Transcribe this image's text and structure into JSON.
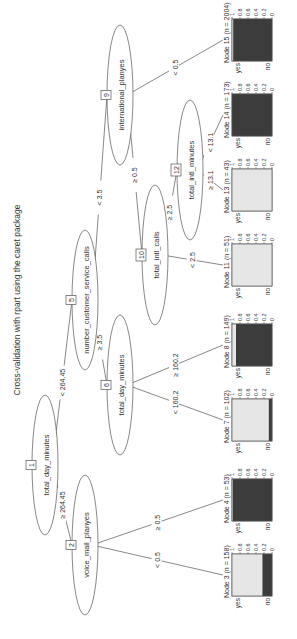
{
  "title": "Cross-validation with rpart using the caret package",
  "orientation": "rotated 90 degrees counter-clockwise",
  "colors": {
    "background": "#ffffff",
    "line": "#555555",
    "bar_yes": "#e6e6e6",
    "bar_no": "#3c3c3c",
    "text": "#333333"
  },
  "inner_nodes": [
    {
      "id": "1",
      "variable": "total_day_minutes",
      "cx": 174,
      "cy": 45,
      "rx": 70,
      "ry": 13
    },
    {
      "id": "2",
      "variable": "voice_mail_planyes",
      "cx": 94,
      "cy": 85,
      "rx": 70,
      "ry": 13
    },
    {
      "id": "5",
      "variable": "number_customer_service_calls",
      "cx": 339,
      "cy": 85,
      "rx": 70,
      "ry": 13
    },
    {
      "id": "6",
      "variable": "total_day_minutes",
      "cx": 254,
      "cy": 120,
      "rx": 70,
      "ry": 13
    },
    {
      "id": "9",
      "variable": "international_planyes",
      "cx": 544,
      "cy": 120,
      "rx": 70,
      "ry": 13
    },
    {
      "id": "10",
      "variable": "total_intl_calls",
      "cx": 384,
      "cy": 155,
      "rx": 70,
      "ry": 13
    },
    {
      "id": "12",
      "variable": "total_intl_minutes",
      "cx": 469,
      "cy": 190,
      "rx": 70,
      "ry": 13
    }
  ],
  "edges": [
    {
      "from": "1",
      "to": "2",
      "label": "≥ 264.45"
    },
    {
      "from": "1",
      "to": "5",
      "label": "< 264.45"
    },
    {
      "from": "2",
      "to": "3",
      "label": "< 0.5"
    },
    {
      "from": "2",
      "to": "4",
      "label": "≥ 0.5"
    },
    {
      "from": "5",
      "to": "6",
      "label": "≥ 3.5"
    },
    {
      "from": "5",
      "to": "9",
      "label": "< 3.5"
    },
    {
      "from": "6",
      "to": "7",
      "label": "< 160.2"
    },
    {
      "from": "6",
      "to": "8",
      "label": "≥ 160.2"
    },
    {
      "from": "9",
      "to": "10",
      "label": "≥ 0.5"
    },
    {
      "from": "9",
      "to": "15",
      "label": "< 0.5"
    },
    {
      "from": "10",
      "to": "11",
      "label": "< 2.5"
    },
    {
      "from": "10",
      "to": "12",
      "label": "≥ 2.5"
    },
    {
      "from": "12",
      "to": "13",
      "label": "≥ 13.1"
    },
    {
      "from": "12",
      "to": "14",
      "label": "< 13.1"
    }
  ],
  "leaves": [
    {
      "id": "3",
      "label": "Node 3 (n = 158)",
      "n": 158,
      "yes": 0.76,
      "no": 0.24,
      "cx": 64
    },
    {
      "id": "4",
      "label": "Node 4 (n = 53)",
      "n": 53,
      "yes": 0.02,
      "no": 0.98,
      "cx": 139
    },
    {
      "id": "7",
      "label": "Node 7 (n = 102)",
      "n": 102,
      "yes": 0.92,
      "no": 0.08,
      "cx": 219
    },
    {
      "id": "8",
      "label": "Node 8 (n = 149)",
      "n": 149,
      "yes": 0.1,
      "no": 0.9,
      "cx": 294
    },
    {
      "id": "11",
      "label": "Node 11 (n = 51)",
      "n": 51,
      "yes": 1.0,
      "no": 0.0,
      "cx": 374
    },
    {
      "id": "13",
      "label": "Node 13 (n = 43)",
      "n": 43,
      "yes": 1.0,
      "no": 0.0,
      "cx": 449
    },
    {
      "id": "14",
      "label": "Node 14 (n = 173)",
      "n": 173,
      "yes": 0.0,
      "no": 1.0,
      "cx": 524
    },
    {
      "id": "15",
      "label": "Node 15 (n = 2004)",
      "n": 2004,
      "yes": 0.03,
      "no": 0.97,
      "cx": 599
    }
  ],
  "leaf_axis": {
    "ticks": [
      "0",
      "0.2",
      "0.4",
      "0.6",
      "0.8",
      "1"
    ],
    "categories": [
      "yes",
      "no"
    ]
  }
}
